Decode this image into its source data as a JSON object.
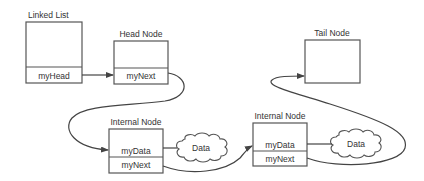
{
  "diagram": {
    "colors": {
      "stroke": "#555555",
      "text": "#333333",
      "background": "#ffffff"
    },
    "nodes": {
      "linked_list": {
        "title": "Linked List",
        "field": "myHead"
      },
      "head_node": {
        "title": "Head Node",
        "field": "myNext"
      },
      "tail_node": {
        "title": "Tail Node"
      },
      "internal_1": {
        "title": "Internal Node",
        "data_field": "myData",
        "next_field": "myNext"
      },
      "internal_2": {
        "title": "Internal Node",
        "data_field": "myData",
        "next_field": "myNext"
      }
    },
    "clouds": [
      {
        "label": "Data"
      },
      {
        "label": "Data"
      }
    ],
    "edges": [
      {
        "from": "Linked List.myHead",
        "to": "Head Node"
      },
      {
        "from": "Head Node.myNext",
        "to": "Internal Node 1"
      },
      {
        "from": "Internal Node 1.myData",
        "to": "Data 1"
      },
      {
        "from": "Internal Node 1.myNext",
        "to": "Internal Node 2"
      },
      {
        "from": "Internal Node 2.myData",
        "to": "Data 2"
      },
      {
        "from": "Internal Node 2.myNext",
        "to": "Tail Node"
      }
    ]
  }
}
